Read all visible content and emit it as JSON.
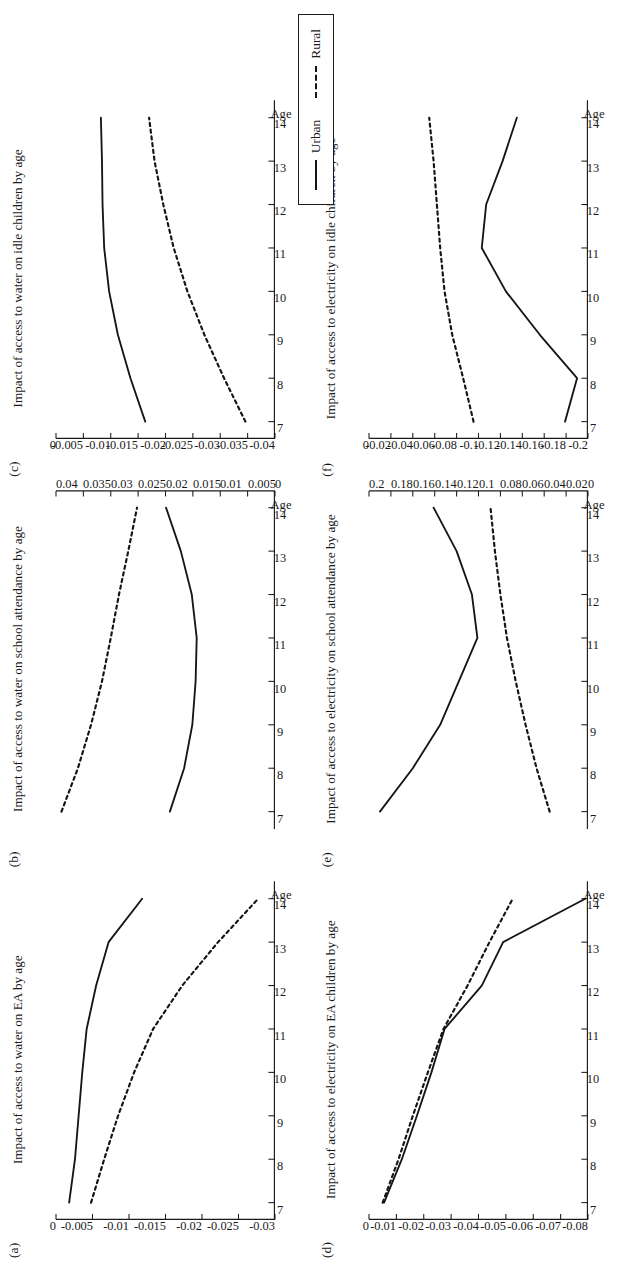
{
  "figure": {
    "legend": {
      "urban_label": "Urban",
      "rural_label": "Rural",
      "urban_style": "solid",
      "rural_style": "dashed"
    },
    "axis_name": "Age",
    "ink_color": "#151515"
  },
  "chart_data": [
    {
      "panel": "a",
      "tag": "(a)",
      "type": "line",
      "title": "Impact of access to water on EA by age",
      "xlabel": "Age",
      "ylabel": "",
      "x": [
        7,
        8,
        9,
        10,
        11,
        12,
        13,
        14
      ],
      "xticks": [
        "7",
        "8",
        "9",
        "10",
        "11",
        "12",
        "13",
        "14"
      ],
      "xlim": [
        6.6,
        14.4
      ],
      "ylim": [
        -0.03,
        0
      ],
      "yticks": [
        0,
        -0.005,
        -0.01,
        -0.015,
        -0.02,
        -0.025,
        -0.03
      ],
      "ytick_labels": [
        "0",
        "-0.005",
        "-0.01",
        "-0.015",
        "-0.02",
        "-0.025",
        "-0.03"
      ],
      "axis_side": "left",
      "grid": false,
      "series": [
        {
          "name": "Urban",
          "style": "solid",
          "values": [
            -0.0018,
            -0.0026,
            -0.0031,
            -0.0036,
            -0.0042,
            -0.0055,
            -0.0072,
            -0.0118
          ]
        },
        {
          "name": "Rural",
          "style": "dashed",
          "values": [
            -0.0048,
            -0.0066,
            -0.0085,
            -0.0107,
            -0.0133,
            -0.0173,
            -0.0222,
            -0.0277
          ]
        }
      ]
    },
    {
      "panel": "b",
      "tag": "(b)",
      "type": "line",
      "title": "Impact of access to water on school attendance by age",
      "xlabel": "Age",
      "ylabel": "",
      "x": [
        7,
        8,
        9,
        10,
        11,
        12,
        13,
        14
      ],
      "xticks": [
        "7",
        "8",
        "9",
        "10",
        "11",
        "12",
        "13",
        "14"
      ],
      "xlim": [
        6.6,
        14.4
      ],
      "ylim": [
        0,
        0.04
      ],
      "yticks": [
        0.04,
        0.035,
        0.03,
        0.025,
        0.02,
        0.015,
        0.01,
        0.005,
        0
      ],
      "ytick_labels": [
        "0.04",
        "0.035",
        "0.03",
        "0.025",
        "0.02",
        "0.015",
        "0.01",
        "0.005",
        "0"
      ],
      "axis_side": "right",
      "grid": false,
      "series": [
        {
          "name": "Urban",
          "style": "solid",
          "values": [
            0.0192,
            0.0166,
            0.0151,
            0.0145,
            0.0143,
            0.0152,
            0.0172,
            0.0199
          ]
        },
        {
          "name": "Rural",
          "style": "dashed",
          "values": [
            0.039,
            0.036,
            0.0336,
            0.0316,
            0.03,
            0.0285,
            0.0268,
            0.0252
          ]
        }
      ]
    },
    {
      "panel": "c",
      "tag": "(c)",
      "type": "line",
      "title": "Impact of access to water on idle children by age",
      "xlabel": "Age",
      "ylabel": "",
      "x": [
        7,
        8,
        9,
        10,
        11,
        12,
        13,
        14
      ],
      "xticks": [
        "7",
        "8",
        "9",
        "10",
        "11",
        "12",
        "13",
        "14"
      ],
      "xlim": [
        6.6,
        14.4
      ],
      "ylim": [
        -0.04,
        0
      ],
      "yticks": [
        0,
        -0.005,
        -0.01,
        -0.015,
        -0.02,
        -0.025,
        -0.03,
        -0.035,
        -0.04
      ],
      "ytick_labels": [
        "0",
        "-0.005",
        "-0.01",
        "-0.015",
        "-0.02",
        "-0.025",
        "-0.03",
        "-0.035",
        "-0.04"
      ],
      "axis_side": "left",
      "grid": false,
      "series": [
        {
          "name": "Urban",
          "style": "solid",
          "values": [
            -0.0163,
            -0.0136,
            -0.0113,
            -0.0097,
            -0.0088,
            -0.0085,
            -0.0084,
            -0.0082
          ]
        },
        {
          "name": "Rural",
          "style": "dashed",
          "values": [
            -0.0346,
            -0.0307,
            -0.0271,
            -0.024,
            -0.0215,
            -0.0196,
            -0.018,
            -0.017
          ]
        }
      ]
    },
    {
      "panel": "d",
      "tag": "(d)",
      "type": "line",
      "title": "Impact of access to electricity on EA children by age",
      "xlabel": "Age",
      "ylabel": "",
      "x": [
        7,
        8,
        9,
        10,
        11,
        12,
        13,
        14
      ],
      "xticks": [
        "7",
        "8",
        "9",
        "10",
        "11",
        "12",
        "13",
        "14"
      ],
      "xlim": [
        6.6,
        14.4
      ],
      "ylim": [
        -0.08,
        0
      ],
      "yticks": [
        0,
        -0.01,
        -0.02,
        -0.03,
        -0.04,
        -0.05,
        -0.06,
        -0.07,
        -0.08
      ],
      "ytick_labels": [
        "0",
        "-0.01",
        "-0.02",
        "-0.03",
        "-0.04",
        "-0.05",
        "-0.06",
        "-0.07",
        "-0.08"
      ],
      "axis_side": "left",
      "grid": false,
      "series": [
        {
          "name": "Urban",
          "style": "solid",
          "values": [
            -0.0055,
            -0.012,
            -0.0175,
            -0.0228,
            -0.0276,
            -0.0412,
            -0.049,
            -0.079
          ]
        },
        {
          "name": "Rural",
          "style": "dashed",
          "values": [
            -0.005,
            -0.0108,
            -0.016,
            -0.0215,
            -0.0272,
            -0.036,
            -0.044,
            -0.0525
          ]
        }
      ]
    },
    {
      "panel": "e",
      "tag": "(e)",
      "type": "line",
      "title": "Impact of access to electricity on school attendance by age",
      "xlabel": "Age",
      "ylabel": "",
      "x": [
        7,
        8,
        9,
        10,
        11,
        12,
        13,
        14
      ],
      "xticks": [
        "7",
        "8",
        "9",
        "10",
        "11",
        "12",
        "13",
        "14"
      ],
      "xlim": [
        6.6,
        14.4
      ],
      "ylim": [
        0,
        0.2
      ],
      "yticks": [
        0.2,
        0.18,
        0.16,
        0.14,
        0.12,
        0.1,
        0.08,
        0.06,
        0.04,
        0.02,
        0
      ],
      "ytick_labels": [
        "0.2",
        "0.18",
        "0.16",
        "0.14",
        "0.12",
        "0.1",
        "0.08",
        "0.06",
        "0.04",
        "0.02",
        "0"
      ],
      "axis_side": "right",
      "grid": false,
      "series": [
        {
          "name": "Urban",
          "style": "solid",
          "values": [
            0.19,
            0.16,
            0.135,
            0.118,
            0.101,
            0.106,
            0.12,
            0.141
          ]
        },
        {
          "name": "Rural",
          "style": "dashed",
          "values": [
            0.035,
            0.047,
            0.057,
            0.066,
            0.074,
            0.08,
            0.085,
            0.089
          ]
        }
      ]
    },
    {
      "panel": "f",
      "tag": "(f)",
      "type": "line",
      "title": "Impact of access to electricity on idle children by age",
      "xlabel": "Age",
      "ylabel": "",
      "x": [
        7,
        8,
        9,
        10,
        11,
        12,
        13,
        14
      ],
      "xticks": [
        "7",
        "8",
        "9",
        "10",
        "11",
        "12",
        "13",
        "14"
      ],
      "xlim": [
        6.6,
        14.4
      ],
      "ylim": [
        -0.2,
        0
      ],
      "yticks": [
        0,
        -0.02,
        -0.04,
        -0.06,
        -0.08,
        -0.1,
        -0.12,
        -0.14,
        -0.16,
        -0.18,
        -0.2
      ],
      "ytick_labels": [
        "0",
        "-0.02",
        "-0.04",
        "-0.06",
        "-0.08",
        "-0.1",
        "-0.12",
        "-0.14",
        "-0.16",
        "-0.18",
        "-0.2"
      ],
      "axis_side": "left",
      "grid": false,
      "series": [
        {
          "name": "Urban",
          "style": "solid",
          "values": [
            -0.179,
            -0.19,
            -0.156,
            -0.125,
            -0.103,
            -0.107,
            -0.122,
            -0.135
          ]
        },
        {
          "name": "Rural",
          "style": "dashed",
          "values": [
            -0.0955,
            -0.086,
            -0.076,
            -0.069,
            -0.065,
            -0.062,
            -0.059,
            -0.055
          ]
        }
      ]
    }
  ]
}
